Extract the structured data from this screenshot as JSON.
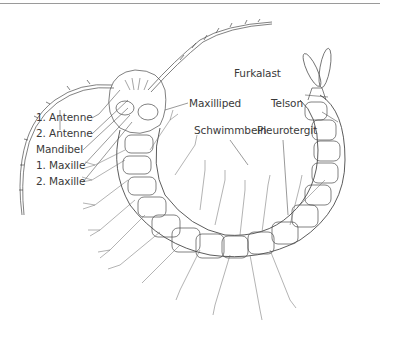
{
  "figure": {
    "labels": {
      "antenne1": "1. Antenne",
      "antenne2": "2. Antenne",
      "mandibel": "Mandibel",
      "maxille1": "1. Maxille",
      "maxille2": "2. Maxille",
      "maxilliped": "Maxilliped",
      "schwimmbein": "Schwimmbein",
      "pleurotergit": "Pleurotergit",
      "furkalast": "Furkalast",
      "telson": "Telson"
    },
    "colors": {
      "line": "#4a4a4a",
      "label": "#3a3a3a",
      "rule": "#9a9a9a",
      "background": "#ffffff"
    }
  }
}
